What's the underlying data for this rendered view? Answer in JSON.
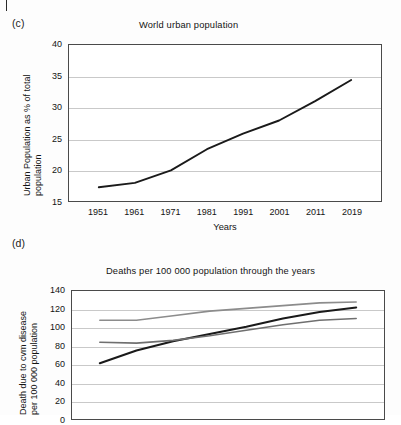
{
  "figure": {
    "panel_c_label": "(c)",
    "panel_d_label": "(d)"
  },
  "chart_data": [
    {
      "id": "c",
      "type": "line",
      "title": "World urban population",
      "xlabel": "Years",
      "ylabel": "Urban Population as % of total population",
      "ylabel_line1": "Urban Population as % of total",
      "ylabel_line2": "population",
      "categories": [
        "1951",
        "1961",
        "1971",
        "1981",
        "1991",
        "2001",
        "2011",
        "2019"
      ],
      "ylim": [
        15,
        40
      ],
      "yticks": [
        "15",
        "20",
        "25",
        "30",
        "35",
        "40"
      ],
      "grid": true,
      "legend": "none",
      "series": [
        {
          "name": "World urban population (% of total)",
          "color": "#1a1a1a",
          "values": [
            17.2,
            17.9,
            19.9,
            23.3,
            25.8,
            27.9,
            31.0,
            34.4
          ]
        }
      ]
    },
    {
      "id": "d",
      "type": "line",
      "title": "Deaths per 100 000 population through the years",
      "xlabel": "",
      "ylabel": "Death due to cvm disease per 100 000 population",
      "ylabel_line1": "Death due to cvm disease",
      "ylabel_line2": "per 100 000 population",
      "categories": [
        "1951",
        "1961",
        "1971",
        "1981",
        "1991",
        "2001",
        "2011",
        "2019"
      ],
      "ylim": [
        0,
        140
      ],
      "yticks": [
        "0",
        "20",
        "40",
        "60",
        "80",
        "100",
        "120",
        "140"
      ],
      "grid": true,
      "legend": "none",
      "series": [
        {
          "name": "upper series",
          "color": "#8c8c8c",
          "values": [
            108,
            108,
            113,
            118,
            121,
            124,
            127,
            128
          ]
        },
        {
          "name": "middle series",
          "color": "#1a1a1a",
          "values": [
            61,
            75,
            85,
            93,
            101,
            110,
            117,
            122
          ]
        },
        {
          "name": "lower series",
          "color": "#6f6f6f",
          "values": [
            84,
            83,
            86,
            91,
            97,
            103,
            108,
            110
          ]
        }
      ]
    }
  ]
}
